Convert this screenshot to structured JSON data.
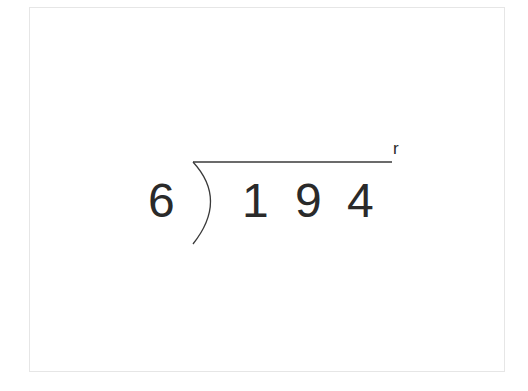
{
  "problem": {
    "type": "long-division",
    "divisor": "6",
    "dividend_digits": [
      "1",
      "9",
      "4"
    ],
    "remainder_label": "r"
  },
  "colors": {
    "ink": "#2a2a2a",
    "frame_border": "#e6e6e6",
    "background": "#ffffff"
  }
}
